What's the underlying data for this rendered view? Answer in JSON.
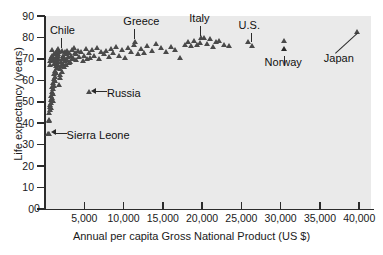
{
  "chart_data": {
    "type": "scatter",
    "title": "",
    "xlabel": "Annual per capita Gross National Product (US $)",
    "ylabel": "Life expectancy (years)",
    "xlim": [
      0,
      41500
    ],
    "ylim": [
      0,
      90
    ],
    "grid": false,
    "legend": "none",
    "marker": "triangle",
    "marker_color": "#4a4a4a",
    "plot_background": "#eaeaea",
    "xticks": [
      0,
      5000,
      10000,
      15000,
      20000,
      25000,
      30000,
      35000,
      40000
    ],
    "xtick_labels": [
      "0",
      "5,000",
      "10,000",
      "15,000",
      "20,000",
      "25,000",
      "30,000",
      "35,000",
      "40,000"
    ],
    "yticks": [
      0,
      10,
      20,
      30,
      40,
      50,
      60,
      70,
      80,
      90
    ],
    "ytick_labels": [
      "0",
      "10",
      "20",
      "30",
      "40",
      "50",
      "60",
      "70",
      "80",
      "90"
    ],
    "points": [
      [
        420,
        34.5
      ],
      [
        480,
        41.0
      ],
      [
        520,
        40.5
      ],
      [
        560,
        44.0
      ],
      [
        600,
        47.0
      ],
      [
        640,
        45.5
      ],
      [
        700,
        48.0
      ],
      [
        720,
        50.5
      ],
      [
        760,
        46.5
      ],
      [
        800,
        52.0
      ],
      [
        820,
        49.0
      ],
      [
        860,
        54.0
      ],
      [
        900,
        51.0
      ],
      [
        940,
        56.5
      ],
      [
        980,
        53.0
      ],
      [
        1000,
        58.0
      ],
      [
        1040,
        50.0
      ],
      [
        1080,
        55.5
      ],
      [
        1120,
        60.0
      ],
      [
        1160,
        57.0
      ],
      [
        1200,
        62.5
      ],
      [
        1240,
        59.0
      ],
      [
        1280,
        64.0
      ],
      [
        1320,
        61.0
      ],
      [
        1360,
        66.0
      ],
      [
        1400,
        63.0
      ],
      [
        1440,
        67.5
      ],
      [
        1480,
        65.0
      ],
      [
        1520,
        69.0
      ],
      [
        1560,
        68.0
      ],
      [
        1600,
        70.5
      ],
      [
        1640,
        66.5
      ],
      [
        1680,
        71.5
      ],
      [
        1720,
        69.5
      ],
      [
        1760,
        72.5
      ],
      [
        620,
        66.5
      ],
      [
        680,
        68.5
      ],
      [
        760,
        70.0
      ],
      [
        840,
        71.0
      ],
      [
        900,
        73.5
      ],
      [
        980,
        69.0
      ],
      [
        1060,
        70.5
      ],
      [
        1140,
        67.0
      ],
      [
        1220,
        71.5
      ],
      [
        1300,
        68.5
      ],
      [
        1380,
        72.0
      ],
      [
        1460,
        70.0
      ],
      [
        1540,
        73.0
      ],
      [
        1620,
        71.0
      ],
      [
        1700,
        74.0
      ],
      [
        1800,
        57.5
      ],
      [
        1860,
        62.0
      ],
      [
        1920,
        64.5
      ],
      [
        1980,
        60.5
      ],
      [
        2040,
        66.0
      ],
      [
        2100,
        68.0
      ],
      [
        2160,
        63.5
      ],
      [
        2220,
        69.5
      ],
      [
        2280,
        67.0
      ],
      [
        2340,
        71.0
      ],
      [
        2400,
        65.5
      ],
      [
        2460,
        70.0
      ],
      [
        2520,
        72.5
      ],
      [
        2580,
        68.5
      ],
      [
        2640,
        71.5
      ],
      [
        2700,
        66.5
      ],
      [
        2780,
        69.0
      ],
      [
        2860,
        73.0
      ],
      [
        2940,
        70.5
      ],
      [
        3020,
        67.5
      ],
      [
        3100,
        72.0
      ],
      [
        3200,
        68.0
      ],
      [
        3300,
        71.0
      ],
      [
        3400,
        69.5
      ],
      [
        3500,
        73.5
      ],
      [
        3600,
        70.0
      ],
      [
        3700,
        74.5
      ],
      [
        3800,
        72.0
      ],
      [
        3900,
        69.0
      ],
      [
        4000,
        71.5
      ],
      [
        4200,
        73.0
      ],
      [
        4400,
        70.5
      ],
      [
        4600,
        72.5
      ],
      [
        4800,
        68.5
      ],
      [
        5000,
        71.0
      ],
      [
        5200,
        74.0
      ],
      [
        5400,
        69.5
      ],
      [
        5600,
        72.0
      ],
      [
        5800,
        70.0
      ],
      [
        6000,
        73.5
      ],
      [
        6300,
        71.0
      ],
      [
        6600,
        74.5
      ],
      [
        6900,
        69.5
      ],
      [
        7200,
        72.5
      ],
      [
        7500,
        71.5
      ],
      [
        7800,
        73.0
      ],
      [
        8100,
        70.5
      ],
      [
        8400,
        74.0
      ],
      [
        8700,
        72.0
      ],
      [
        9000,
        75.0
      ],
      [
        9400,
        71.0
      ],
      [
        9800,
        73.5
      ],
      [
        10200,
        70.0
      ],
      [
        10600,
        74.5
      ],
      [
        11000,
        72.5
      ],
      [
        11400,
        76.0
      ],
      [
        11800,
        71.5
      ],
      [
        12200,
        74.0
      ],
      [
        12600,
        72.0
      ],
      [
        13000,
        75.5
      ],
      [
        13600,
        73.0
      ],
      [
        14200,
        76.5
      ],
      [
        14800,
        74.5
      ],
      [
        15400,
        72.5
      ],
      [
        16000,
        75.0
      ],
      [
        16600,
        73.5
      ],
      [
        17200,
        70.0
      ],
      [
        17800,
        76.0
      ],
      [
        18200,
        77.5
      ],
      [
        18600,
        75.5
      ],
      [
        19000,
        78.0
      ],
      [
        19400,
        76.0
      ],
      [
        19800,
        77.0
      ],
      [
        20200,
        79.0
      ],
      [
        20600,
        76.5
      ],
      [
        21000,
        78.5
      ],
      [
        21400,
        75.0
      ],
      [
        21800,
        77.5
      ],
      [
        22200,
        78.0
      ],
      [
        22800,
        76.0
      ],
      [
        23400,
        75.5
      ],
      [
        25900,
        77.5
      ],
      [
        26300,
        75.5
      ],
      [
        30500,
        78.0
      ],
      [
        39700,
        82.0
      ],
      [
        2150,
        73.0
      ],
      [
        5600,
        54.0
      ],
      [
        11500,
        77.5
      ],
      [
        19900,
        79.0
      ],
      [
        460,
        34.5
      ]
    ],
    "annotations": [
      {
        "name": "Chile",
        "label": "Chile",
        "value_x": 2150,
        "value_y": 73.0,
        "leader": "vertical-down"
      },
      {
        "name": "Greece",
        "label": "Greece",
        "value_x": 11500,
        "value_y": 77.5,
        "leader": "vertical-down"
      },
      {
        "name": "Italy",
        "label": "Italy",
        "value_x": 19900,
        "value_y": 79.0,
        "leader": "vertical-down"
      },
      {
        "name": "U.S.",
        "label": "U.S.",
        "value_x": 26300,
        "value_y": 75.5,
        "leader": "vertical-down-arrow"
      },
      {
        "name": "Norway",
        "label": "Norway",
        "value_x": 30500,
        "value_y": 78.0,
        "leader": "vertical-up-arrow"
      },
      {
        "name": "Japan",
        "label": "Japan",
        "value_x": 39700,
        "value_y": 82.0,
        "leader": "diagonal-up-arrow"
      },
      {
        "name": "Russia",
        "label": "Russia",
        "value_x": 5600,
        "value_y": 54.0,
        "leader": "horizontal-left-arrow"
      },
      {
        "name": "Sierra Leone",
        "label": "Sierra Leone",
        "value_x": 460,
        "value_y": 34.5,
        "leader": "horizontal-left-arrow"
      }
    ]
  }
}
